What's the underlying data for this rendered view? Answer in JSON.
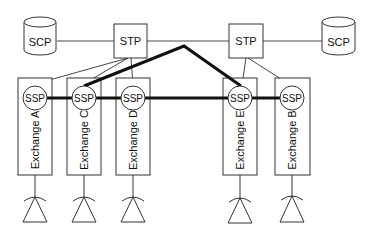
{
  "diagram": {
    "title": "",
    "colors": {
      "stroke": "#333333",
      "thick": "#111111",
      "background": "#ffffff"
    },
    "scp_left": {
      "label": "SCP"
    },
    "scp_right": {
      "label": "SCP"
    },
    "stp_left": {
      "label": "STP"
    },
    "stp_right": {
      "label": "STP"
    },
    "exchanges": [
      {
        "id": "A",
        "label": "Exchange A",
        "ssp": "SSP"
      },
      {
        "id": "C",
        "label": "Exchange C",
        "ssp": "SSP"
      },
      {
        "id": "D",
        "label": "Exchange D",
        "ssp": "SSP"
      },
      {
        "id": "E",
        "label": "Exchange E",
        "ssp": "SSP"
      },
      {
        "id": "B",
        "label": "Exchange B",
        "ssp": "SSP"
      }
    ],
    "links": [
      {
        "from": "SCP-left",
        "to": "STP-left",
        "type": "thin"
      },
      {
        "from": "STP-left",
        "to": "STP-right",
        "type": "thin"
      },
      {
        "from": "STP-right",
        "to": "SCP-right",
        "type": "thin"
      },
      {
        "from": "STP-left",
        "to": "SSP-A",
        "type": "thin"
      },
      {
        "from": "STP-left",
        "to": "SSP-C",
        "type": "thin"
      },
      {
        "from": "STP-left",
        "to": "SSP-D",
        "type": "thin"
      },
      {
        "from": "STP-right",
        "to": "SSP-E",
        "type": "thin"
      },
      {
        "from": "STP-right",
        "to": "SSP-B",
        "type": "thin"
      },
      {
        "from": "SSP-A",
        "to": "SSP-C",
        "type": "thick"
      },
      {
        "from": "SSP-C",
        "to": "SSP-D",
        "type": "thick"
      },
      {
        "from": "SSP-D",
        "to": "SSP-E",
        "type": "thick"
      },
      {
        "from": "SSP-E",
        "to": "SSP-B",
        "type": "thick"
      },
      {
        "from": "SSP-C",
        "to": "SSP-E",
        "type": "thick",
        "note": "trunk routed over top"
      }
    ]
  }
}
